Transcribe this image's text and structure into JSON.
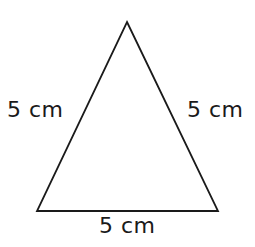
{
  "figure": {
    "shape_name": "triangle",
    "background_color": "#ffffff",
    "stroke_color": "#1a1a1a",
    "stroke_width": 1.8,
    "width": 255,
    "height": 247,
    "vertices": {
      "apex": [
        127,
        22
      ],
      "bottom_left": [
        37,
        211
      ],
      "bottom_right": [
        218,
        211
      ]
    },
    "polygon_points": "127,22 218,211 37,211"
  },
  "labels": {
    "left_side": "5 cm",
    "right_side": "5 cm",
    "bottom_side": "5 cm",
    "text_color": "#1a1a1a",
    "font_size": 22
  }
}
